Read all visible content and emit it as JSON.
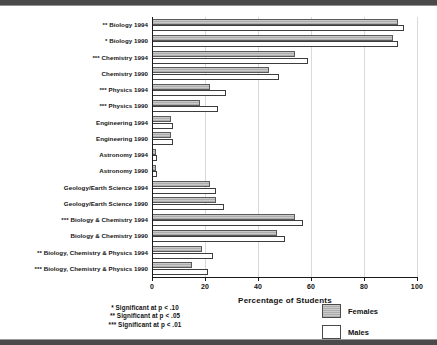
{
  "chart_data": {
    "type": "bar",
    "orientation": "horizontal",
    "title": "",
    "xlabel": "Percentage of Students",
    "ylabel": "",
    "xlim": [
      0,
      100
    ],
    "xticks": [
      0,
      20,
      40,
      60,
      80,
      100
    ],
    "grid": true,
    "legend_position": "bottom-right",
    "categories": [
      "** Biology 1994",
      "* Biology 1990",
      "*** Chemistry 1994",
      "Chemistry 1990",
      "*** Physics 1994",
      "*** Physics 1990",
      "Engineering 1994",
      "Engineering 1990",
      "Astronomy 1994",
      "Astronomy 1990",
      "Geology/Earth Science 1994",
      "Geology/Earth Science 1990",
      "*** Biology & Chemistry 1994",
      "Biology & Chemistry 1990",
      "** Biology, Chemistry & Physics 1994",
      "*** Biology, Chemistry & Physics 1990"
    ],
    "series": [
      {
        "name": "Females",
        "color": "#adadad",
        "values": [
          93,
          91,
          54,
          44,
          22,
          18,
          7,
          7,
          1.5,
          1.5,
          22,
          24,
          54,
          47,
          19,
          15
        ]
      },
      {
        "name": "Males",
        "color": "#ffffff",
        "values": [
          95,
          93,
          59,
          48,
          28,
          25,
          8,
          8,
          2,
          2,
          24,
          27,
          57,
          50,
          23,
          21
        ]
      }
    ]
  },
  "axis": {
    "x_title": "Percentage of Students",
    "tick_labels": [
      "0",
      "20",
      "40",
      "60",
      "80",
      "100"
    ]
  },
  "legend": {
    "items": [
      {
        "label": "Females",
        "swatch": "females-swatch"
      },
      {
        "label": "Males",
        "swatch": "males-swatch"
      }
    ]
  },
  "footnotes": [
    "* Significant at p < .10",
    "** Significant at p < .05",
    "*** Significant at p < .01"
  ]
}
